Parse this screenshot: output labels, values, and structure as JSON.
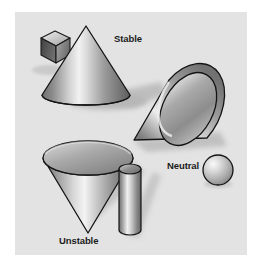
{
  "figure": {
    "panel_background": "#e3e3e3",
    "outer_background": "#ffffff",
    "label_color": "#1b1b1b"
  },
  "labels": {
    "stable": "Stable",
    "neutral": "Neutral",
    "unstable": "Unstable"
  },
  "shapes": [
    {
      "name": "cube",
      "label": "",
      "position": "top-left"
    },
    {
      "name": "upright-cone",
      "label": "Stable",
      "position": "top-center"
    },
    {
      "name": "reclining-cone",
      "label": "Neutral",
      "position": "middle-right"
    },
    {
      "name": "inverted-cone",
      "label": "Unstable",
      "position": "bottom-left"
    },
    {
      "name": "cylinder",
      "label": "",
      "position": "bottom-center"
    },
    {
      "name": "sphere",
      "label": "",
      "position": "middle-right"
    }
  ],
  "palette": {
    "outline": "#1a1a1a",
    "shadow": "#b9b9b9",
    "highlight": "#f4f4f4",
    "midtone": "#9a9a9a",
    "shade": "#6d6d6d",
    "dark": "#4a4a4a"
  }
}
